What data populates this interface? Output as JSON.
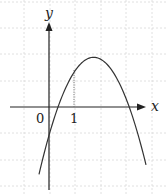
{
  "figure": {
    "type": "function-graph",
    "colors": {
      "background": "#ffffff",
      "grid": "#d8d8d8",
      "axes": "#222222",
      "curve": "#333333",
      "dotted_guide": "#777777"
    },
    "labels": {
      "y_axis": "y",
      "x_axis": "x",
      "origin": "0",
      "tick_one": "1"
    },
    "geometry": {
      "origin_px": [
        49,
        107
      ],
      "unit_px": 25.5,
      "grid_x_px": [
        24,
        50,
        75,
        101,
        126,
        152
      ],
      "grid_y_px": [
        2,
        28,
        54,
        81,
        133,
        160,
        186
      ],
      "x_axis_px": {
        "x1": 10,
        "x2": 146,
        "y": 107
      },
      "y_axis_px": {
        "x": 49,
        "y1": 190,
        "y2": 22
      },
      "dotted_guide_px": {
        "x": 74,
        "y1": 70,
        "y2": 107
      }
    }
  },
  "chart_data": {
    "type": "line",
    "title": "",
    "xlabel": "x",
    "ylabel": "y",
    "function": "y = -(x - 1.75)^2 + 1.95 (approximate)",
    "annotations": [
      {
        "label": "0",
        "x": 0,
        "y": 0,
        "note": "origin"
      },
      {
        "label": "1",
        "x": 1,
        "note": "tick with dotted vertical guide from x-axis to curve"
      }
    ],
    "key_points": {
      "vertex": [
        1.75,
        1.95
      ],
      "x_intercepts": [
        0.3,
        3.15
      ],
      "y_intercept": -1.1,
      "point_at_x_1": [
        1,
        1.45
      ]
    },
    "x": [
      -0.4,
      0,
      0.3,
      1,
      1.75,
      2.5,
      3.15,
      3.8
    ],
    "series": [
      {
        "name": "f(x)",
        "values": [
          -2.7,
          -1.1,
          0,
          1.45,
          1.95,
          1.4,
          0,
          -2.3
        ]
      }
    ],
    "xlim": [
      -1.5,
      4.0
    ],
    "ylim": [
      -3.3,
      3.3
    ],
    "grid": true,
    "grid_style": "dashed light gray"
  }
}
